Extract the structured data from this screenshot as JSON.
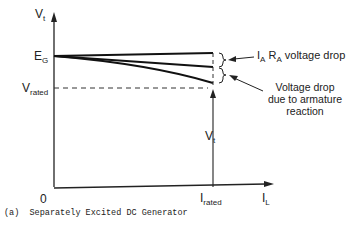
{
  "axes": {
    "y_label": "V",
    "y_label_sub": "t",
    "x_label": "I",
    "x_label_sub": "L",
    "origin": "0"
  },
  "levels": {
    "eg": "E",
    "eg_sub": "G",
    "vrated": "V",
    "vrated_sub": "rated",
    "irated": "I",
    "irated_sub": "rated",
    "vt": "V",
    "vt_sub": "t"
  },
  "annotations": {
    "ia_ra_prefix1": "I",
    "ia_ra_sub1": "A",
    "ia_ra_prefix2": " R",
    "ia_ra_sub2": "A",
    "ia_ra_text": " voltage drop",
    "armature_line1": "Voltage drop",
    "armature_line2": "due to armature",
    "armature_line3": "reaction"
  },
  "caption": "(a)  Separately Excited DC Generator"
}
